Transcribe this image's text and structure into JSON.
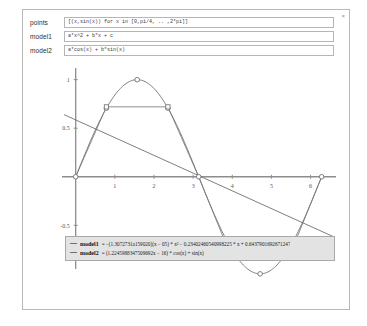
{
  "window": {
    "close_label": "×"
  },
  "inputs": [
    {
      "label": "points",
      "value": "[(x,sin(x)) for x in [0,pi/4, .. ,2*pi]]",
      "placeholder": "points expression"
    },
    {
      "label": "model1",
      "value": "a*x^2 + b*x + c",
      "placeholder": "model expression"
    },
    {
      "label": "model2",
      "value": "a*cos(x) + b*sin(x)",
      "placeholder": "model expression"
    }
  ],
  "legend": {
    "entries": [
      {
        "name": "model1",
        "equation": "= −(1.3072731a159020)(x − 05) * x² − 0.23402460540998225 * x + 0.6437901692671247"
      },
      {
        "name": "model2",
        "equation": "= (1.2245988347509692x − 16) * cos(x) + sin(x)"
      }
    ]
  },
  "chart_data": {
    "type": "scatter",
    "title": "",
    "xlabel": "",
    "ylabel": "",
    "xlim": [
      -0.35,
      6.65
    ],
    "ylim": [
      -0.95,
      1.12
    ],
    "grid": false,
    "xticks": [
      1,
      2,
      3,
      4,
      5,
      6
    ],
    "yticks": [
      -0.5,
      0.5,
      1
    ],
    "ytick_labels": [
      "-0.5",
      "0.5",
      "1"
    ],
    "xtick_labels": [
      "1",
      "2",
      "3",
      "4",
      "5",
      "6"
    ],
    "legend_position": "bottom-center",
    "series": [
      {
        "name": "data-points",
        "marker": "circle",
        "color": "#6f6f6f",
        "x": [
          0,
          0.785,
          1.571,
          2.356,
          3.142,
          3.927,
          4.712,
          5.498,
          6.283
        ],
        "y": [
          0,
          0.707,
          1,
          0.707,
          0,
          -0.707,
          -1,
          -0.707,
          0
        ]
      },
      {
        "name": "model1",
        "marker": "square",
        "color": "#7a7a7a",
        "x": [
          0.785,
          2.356,
          3.927,
          5.498
        ],
        "y": [
          0.72,
          0.72,
          -0.78,
          -0.78
        ]
      },
      {
        "name": "model2",
        "marker": "line",
        "color": "#6f6f6f",
        "x": [
          -0.3,
          6.6
        ],
        "y": [
          0.64,
          -0.62
        ]
      }
    ]
  }
}
